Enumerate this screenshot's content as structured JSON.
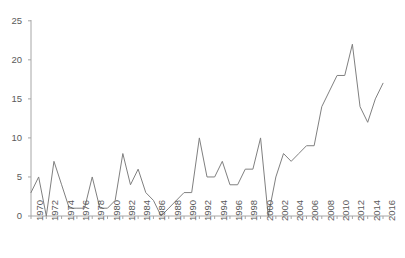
{
  "chart_data": {
    "type": "line",
    "title": "",
    "subtitle": "",
    "xlabel": "",
    "ylabel": "",
    "grid": false,
    "legend": null,
    "legend_position": "none",
    "line_color": "#808080",
    "background_color": "#ffffff",
    "axis_color": "#a6a6a6",
    "tick_label_color": "#5a5a5a",
    "xlim": [
      1970,
      2016
    ],
    "ylim": [
      0,
      25
    ],
    "y_ticks": [
      0,
      5,
      10,
      15,
      20,
      25
    ],
    "y_tick_labels": [
      "0",
      "5",
      "10",
      "15",
      "20",
      "25"
    ],
    "x_ticks": [
      1970,
      1972,
      1974,
      1976,
      1978,
      1980,
      1982,
      1984,
      1986,
      1988,
      1990,
      1992,
      1994,
      1996,
      1998,
      2000,
      2002,
      2004,
      2006,
      2008,
      2010,
      2012,
      2014,
      2016
    ],
    "x_tick_labels": [
      "1970",
      "1972",
      "1974",
      "1976",
      "1978",
      "1980",
      "1982",
      "1984",
      "1986",
      "1988",
      "1990",
      "1992",
      "1994",
      "1996",
      "1998",
      "2000",
      "2002",
      "2004",
      "2006",
      "2008",
      "2010",
      "2012",
      "2014",
      "2016"
    ],
    "x_tick_label_rotation": -90,
    "x": [
      1970,
      1971,
      1972,
      1973,
      1974,
      1975,
      1976,
      1977,
      1978,
      1979,
      1980,
      1981,
      1982,
      1983,
      1984,
      1985,
      1986,
      1987,
      1988,
      1989,
      1990,
      1991,
      1992,
      1993,
      1994,
      1995,
      1996,
      1997,
      1998,
      1999,
      2000,
      2001,
      2002,
      2003,
      2004,
      2005,
      2006,
      2007,
      2008,
      2009,
      2010,
      2011,
      2012,
      2013,
      2014,
      2015,
      2016
    ],
    "values": [
      3,
      5,
      0,
      7,
      4,
      1,
      1,
      1,
      5,
      1,
      1,
      2,
      8,
      4,
      6,
      3,
      2,
      0,
      1,
      2,
      3,
      3,
      10,
      5,
      5,
      7,
      4,
      4,
      6,
      6,
      10,
      0,
      5,
      8,
      7,
      8,
      9,
      9,
      14,
      16,
      18,
      18,
      22,
      14,
      12,
      15,
      17
    ],
    "y_max_observed": 22,
    "y_min_observed": 0,
    "n_points": 47,
    "series": [
      {
        "name": "series-1",
        "color": "#808080",
        "line_width": 1,
        "marker": "none",
        "values": [
          3,
          5,
          0,
          7,
          4,
          1,
          1,
          1,
          5,
          1,
          1,
          2,
          8,
          4,
          6,
          3,
          2,
          0,
          1,
          2,
          3,
          3,
          10,
          5,
          5,
          7,
          4,
          4,
          6,
          6,
          10,
          0,
          5,
          8,
          7,
          8,
          9,
          9,
          14,
          16,
          18,
          18,
          22,
          14,
          12,
          15,
          17
        ]
      }
    ]
  },
  "axes": {
    "y_axis_visible": true,
    "x_axis_visible": true,
    "top_spine_visible": false,
    "right_spine_visible": false
  }
}
